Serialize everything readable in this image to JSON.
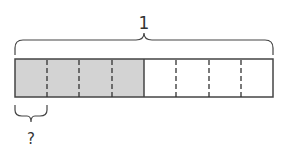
{
  "diagram": {
    "type": "tape-diagram",
    "whole_label": "1",
    "part_label": "?",
    "total_parts": 8,
    "shaded_parts": 4,
    "colors": {
      "shaded": "#d3d3d3",
      "unshaded": "#ffffff",
      "stroke": "#444444"
    }
  }
}
